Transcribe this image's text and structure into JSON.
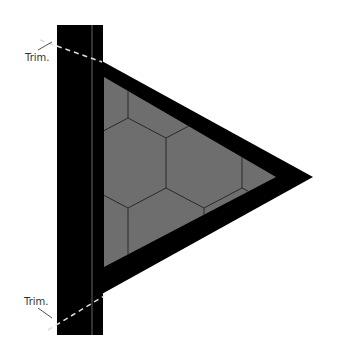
{
  "labels": {
    "top_trim": "Trim.",
    "bottom_trim": "Trim."
  },
  "colors": {
    "pole": "#000000",
    "fill": "#6e6e6e",
    "hex_line": "#333333",
    "trim_line": "#cccccc"
  }
}
